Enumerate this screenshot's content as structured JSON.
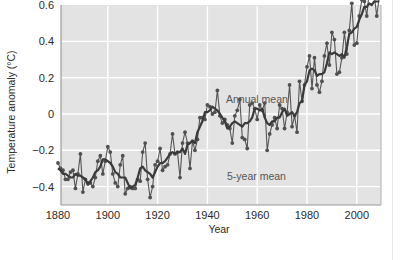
{
  "chart_data": {
    "type": "line",
    "title": "",
    "xlabel": "Year",
    "ylabel": "Temperature anomaly (°C)",
    "xlim": [
      1880,
      2009
    ],
    "ylim": [
      -0.5,
      0.6
    ],
    "x_ticks": [
      "1880",
      "1900",
      "1920",
      "1940",
      "1960",
      "1980",
      "2000"
    ],
    "y_ticks": [
      "0.6",
      "0.4",
      "0.2",
      "0",
      "−0.2",
      "−0.4"
    ],
    "grid": true,
    "legend": "inline annotations",
    "annotations": [
      "Annual mean",
      "5-year mean"
    ],
    "x": [
      1880,
      1881,
      1882,
      1883,
      1884,
      1885,
      1886,
      1887,
      1888,
      1889,
      1890,
      1891,
      1892,
      1893,
      1894,
      1895,
      1896,
      1897,
      1898,
      1899,
      1900,
      1901,
      1902,
      1903,
      1904,
      1905,
      1906,
      1907,
      1908,
      1909,
      1910,
      1911,
      1912,
      1913,
      1914,
      1915,
      1916,
      1917,
      1918,
      1919,
      1920,
      1921,
      1922,
      1923,
      1924,
      1925,
      1926,
      1927,
      1928,
      1929,
      1930,
      1931,
      1932,
      1933,
      1934,
      1935,
      1936,
      1937,
      1938,
      1939,
      1940,
      1941,
      1942,
      1943,
      1944,
      1945,
      1946,
      1947,
      1948,
      1949,
      1950,
      1951,
      1952,
      1953,
      1954,
      1955,
      1956,
      1957,
      1958,
      1959,
      1960,
      1961,
      1962,
      1963,
      1964,
      1965,
      1966,
      1967,
      1968,
      1969,
      1970,
      1971,
      1972,
      1973,
      1974,
      1975,
      1976,
      1977,
      1978,
      1979,
      1980,
      1981,
      1982,
      1983,
      1984,
      1985,
      1986,
      1987,
      1988,
      1989,
      1990,
      1991,
      1992,
      1993,
      1994,
      1995,
      1996,
      1997,
      1998,
      1999,
      2000,
      2001,
      2002,
      2003,
      2004,
      2005,
      2006,
      2007,
      2008,
      2009
    ],
    "series": [
      {
        "name": "Annual mean",
        "values": [
          -0.27,
          -0.3,
          -0.31,
          -0.36,
          -0.36,
          -0.32,
          -0.31,
          -0.41,
          -0.33,
          -0.22,
          -0.43,
          -0.36,
          -0.38,
          -0.38,
          -0.4,
          -0.35,
          -0.26,
          -0.23,
          -0.33,
          -0.26,
          -0.18,
          -0.21,
          -0.33,
          -0.38,
          -0.4,
          -0.28,
          -0.23,
          -0.44,
          -0.41,
          -0.4,
          -0.41,
          -0.41,
          -0.36,
          -0.37,
          -0.21,
          -0.16,
          -0.36,
          -0.46,
          -0.4,
          -0.28,
          -0.26,
          -0.19,
          -0.31,
          -0.29,
          -0.28,
          -0.22,
          -0.11,
          -0.22,
          -0.21,
          -0.35,
          -0.16,
          -0.1,
          -0.16,
          -0.3,
          -0.15,
          -0.2,
          -0.14,
          -0.02,
          -0.02,
          -0.03,
          0.05,
          0.04,
          0.0,
          0.01,
          0.13,
          -0.01,
          -0.05,
          -0.03,
          -0.06,
          -0.08,
          -0.16,
          -0.01,
          0.02,
          0.08,
          -0.13,
          -0.14,
          -0.19,
          0.05,
          0.06,
          0.03,
          -0.03,
          0.05,
          0.02,
          0.06,
          -0.2,
          -0.11,
          -0.06,
          -0.02,
          -0.08,
          0.05,
          0.03,
          -0.08,
          0.01,
          0.16,
          -0.07,
          -0.01,
          -0.1,
          0.18,
          0.07,
          0.16,
          0.26,
          0.32,
          0.14,
          0.31,
          0.16,
          0.12,
          0.18,
          0.32,
          0.39,
          0.27,
          0.45,
          0.41,
          0.22,
          0.23,
          0.31,
          0.45,
          0.33,
          0.46,
          0.61,
          0.38,
          0.39,
          0.54,
          0.63,
          0.62,
          0.54,
          0.68,
          0.64,
          0.66,
          0.54,
          0.64
        ]
      },
      {
        "name": "5-year mean",
        "values": [
          -0.3,
          -0.31,
          -0.33,
          -0.33,
          -0.34,
          -0.35,
          -0.35,
          -0.33,
          -0.34,
          -0.34,
          -0.35,
          -0.36,
          -0.39,
          -0.37,
          -0.35,
          -0.32,
          -0.31,
          -0.29,
          -0.25,
          -0.25,
          -0.26,
          -0.27,
          -0.29,
          -0.32,
          -0.33,
          -0.35,
          -0.35,
          -0.35,
          -0.38,
          -0.41,
          -0.4,
          -0.39,
          -0.35,
          -0.3,
          -0.29,
          -0.31,
          -0.32,
          -0.33,
          -0.35,
          -0.32,
          -0.29,
          -0.27,
          -0.27,
          -0.26,
          -0.24,
          -0.22,
          -0.21,
          -0.22,
          -0.21,
          -0.21,
          -0.19,
          -0.22,
          -0.17,
          -0.16,
          -0.15,
          -0.16,
          -0.1,
          -0.07,
          -0.04,
          0.01,
          0.01,
          0.02,
          0.04,
          0.03,
          0.02,
          0.0,
          -0.02,
          -0.04,
          -0.08,
          -0.07,
          -0.05,
          -0.04,
          -0.05,
          -0.06,
          -0.07,
          -0.05,
          -0.05,
          -0.04,
          -0.02,
          0.03,
          0.03,
          0.02,
          0.03,
          -0.02,
          -0.05,
          -0.06,
          -0.04,
          -0.04,
          -0.02,
          -0.02,
          0.01,
          0.03,
          -0.01,
          0.0,
          0.01,
          -0.01,
          0.01,
          0.06,
          0.07,
          0.16,
          0.18,
          0.24,
          0.25,
          0.24,
          0.21,
          0.22,
          0.22,
          0.23,
          0.28,
          0.34,
          0.33,
          0.34,
          0.33,
          0.32,
          0.33,
          0.31,
          0.37,
          0.44,
          0.45,
          0.47,
          0.48,
          0.52,
          0.55,
          0.59,
          0.59,
          0.61,
          0.6,
          0.62,
          0.62,
          0.62
        ]
      }
    ]
  },
  "labels": {
    "annual_mean": "Annual mean",
    "five_year_mean": "5-year mean",
    "x_axis": "Year",
    "y_axis": "Temperature anomaly (°C)"
  },
  "colors": {
    "plot_background": "#e3e3e3",
    "gridline": "#ffffff",
    "line": "#555555",
    "marker": "#505050",
    "axis_frame": "#9a9a9a",
    "annotation_text": "#5a5a5a"
  }
}
